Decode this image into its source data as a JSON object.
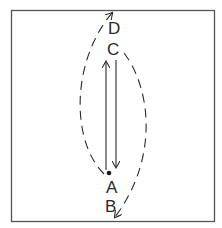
{
  "figure": {
    "labels": {
      "D": "D",
      "C": "C",
      "A": "A",
      "B": "B"
    },
    "elements": {
      "frame": "rectangular border",
      "solid_up_arrow": "from A up toward C",
      "solid_down_arrow": "from C down toward A",
      "dashed_left_arc": "from A curving up-left to D (arrowhead at D)",
      "dashed_right_arc": "from C curving down-right to B (arrowhead at B)",
      "dot": "point at A"
    },
    "colors": {
      "line": "#2a2a2a",
      "frame": "#555555",
      "background": "#ffffff"
    }
  }
}
